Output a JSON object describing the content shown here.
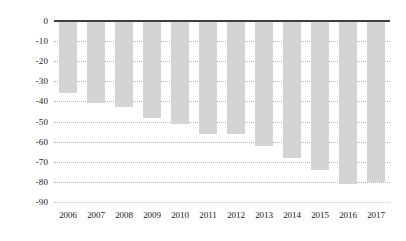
{
  "chart_data": {
    "type": "bar",
    "title": "",
    "xlabel": "",
    "ylabel": "",
    "categories": [
      "2006",
      "2007",
      "2008",
      "2009",
      "2010",
      "2011",
      "2012",
      "2013",
      "2014",
      "2015",
      "2016",
      "2017"
    ],
    "values": [
      -36,
      -41,
      -43,
      -48,
      -51,
      -56,
      -56,
      -62,
      -68,
      -74,
      -81,
      -80
    ],
    "ylim": [
      -90,
      0
    ],
    "ytick_labels": [
      "0",
      "-10",
      "-20",
      "-30",
      "-40",
      "-50",
      "-60",
      "-70",
      "-80",
      "-90"
    ],
    "yticks": [
      0,
      -10,
      -20,
      -30,
      -40,
      -50,
      -60,
      -70,
      -80,
      -90
    ],
    "grid": true,
    "grid_style": "dotted",
    "legend": "none",
    "series": [
      {
        "name": "",
        "values": [
          -36,
          -41,
          -43,
          -48,
          -51,
          -56,
          -56,
          -62,
          -68,
          -74,
          -81,
          -80
        ]
      }
    ],
    "colors": {
      "bar_fill": "#d4d4d4",
      "zero_axis": "#3f3f3f",
      "gridline": "#b9b9b9",
      "background": "#ffffff",
      "text": "#1a1a1a"
    }
  }
}
